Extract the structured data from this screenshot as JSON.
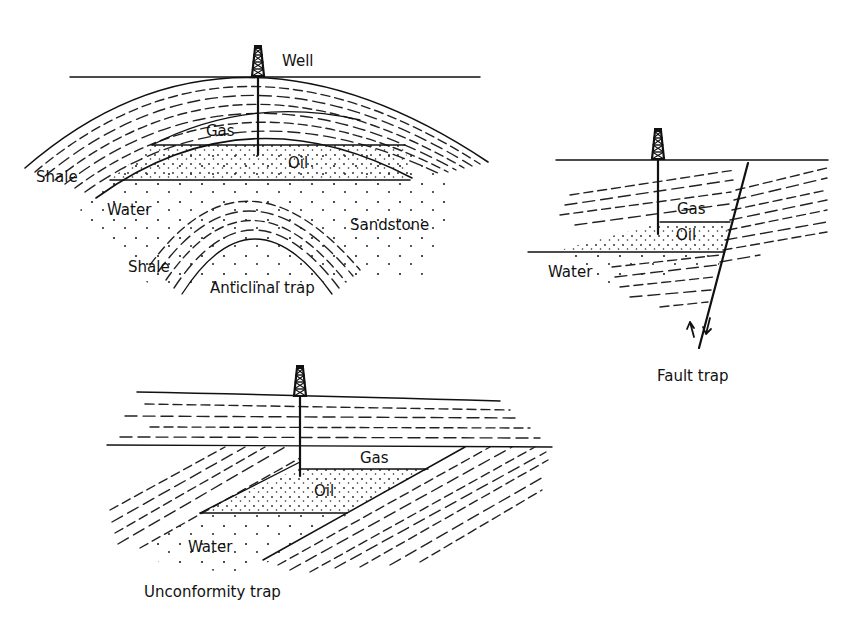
{
  "diagram": {
    "panels": [
      {
        "id": "anticlinal",
        "caption": "Anticlinal trap",
        "labels": {
          "well": "Well",
          "gas": "Gas",
          "oil": "Oil",
          "shale_upper": "Shale",
          "water": "Water",
          "sandstone": "Sandstone",
          "shale_lower": "Shale"
        }
      },
      {
        "id": "fault",
        "caption": "Fault trap",
        "labels": {
          "gas": "Gas",
          "oil": "Oil",
          "water": "Water"
        }
      },
      {
        "id": "unconformity",
        "caption": "Unconformity trap",
        "labels": {
          "gas": "Gas",
          "oil": "Oil",
          "water": "Water"
        }
      }
    ],
    "colors": {
      "ink": "#111111",
      "background": "#ffffff"
    }
  }
}
